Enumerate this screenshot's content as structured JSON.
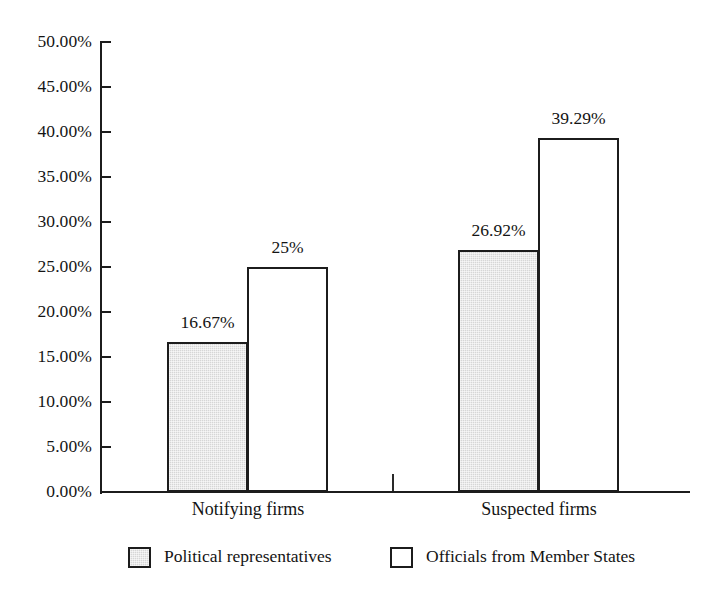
{
  "chart_data": {
    "type": "bar",
    "title": "",
    "subtitle": "",
    "xlabel": "",
    "ylabel": "",
    "categories": [
      "Notifying firms",
      "Suspected firms"
    ],
    "series": [
      {
        "name": "Political representatives",
        "swatch": "gray",
        "values": [
          16.67,
          39.29
        ],
        "values_placeholder_note": "",
        "labels": [
          "16.67%",
          "26.92%"
        ],
        "data": [
          16.67,
          26.92
        ]
      },
      {
        "name": "Officials from Member States",
        "swatch": "white",
        "labels": [
          "25%",
          "39.29%"
        ],
        "data": [
          25.0,
          39.29
        ]
      }
    ],
    "ylim": [
      0,
      50
    ],
    "ytick_step": 5,
    "ytick_labels": [
      "50.00%",
      "45.00%",
      "40.00%",
      "35.00%",
      "30.00%",
      "25.00%",
      "20.00%",
      "15.00%",
      "10.00%",
      "5.00%",
      "0.00%"
    ],
    "ytick_values": [
      50,
      45,
      40,
      35,
      30,
      25,
      20,
      15,
      10,
      5,
      0
    ],
    "grid": false,
    "legend_position": "bottom",
    "colors": {
      "series_1_fill": "#d6d6d6",
      "series_2_fill": "#ffffff",
      "outline": "#1c1c1c",
      "text": "#141414",
      "background": "#ffffff"
    }
  },
  "legend": {
    "items": [
      {
        "label": "Political representatives",
        "swatch": "gray"
      },
      {
        "label": "Officials from Member States",
        "swatch": "white"
      }
    ]
  },
  "bars": [
    {
      "group": "Notifying firms",
      "series": "Political representatives",
      "value": 16.67,
      "label": "16.67%"
    },
    {
      "group": "Notifying firms",
      "series": "Officials from Member States",
      "value": 25.0,
      "label": "25%"
    },
    {
      "group": "Suspected firms",
      "series": "Political representatives",
      "value": 26.92,
      "label": "26.92%"
    },
    {
      "group": "Suspected firms",
      "series": "Officials from Member States",
      "value": 39.29,
      "label": "39.29%"
    }
  ],
  "caption": {
    "cut_off_text": "……  …………   ……  …… …   ……"
  }
}
